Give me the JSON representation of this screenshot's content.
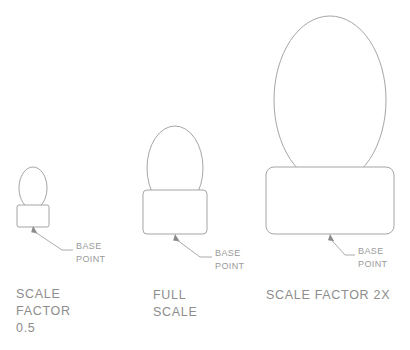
{
  "diagram": {
    "background_color": "#ffffff",
    "stroke_color": "#9b9b9b",
    "text_color": "#8d8d8d",
    "annotation_label_line1": "BASE",
    "annotation_label_line2": "POINT",
    "figures": [
      {
        "id": "small",
        "caption_lines": [
          "SCALE",
          "FACTOR",
          "0.5"
        ],
        "scale_factor": "0.5",
        "ellipse": {
          "cx": 33,
          "cy": 188,
          "rx": 14,
          "ry": 21
        },
        "rect": {
          "x": 17,
          "y": 205,
          "width": 32,
          "height": 22,
          "radius": 2
        },
        "base_point": {
          "x": 33,
          "y": 226
        },
        "leader": {
          "elbow_x": 62,
          "elbow_y": 250,
          "end_x": 73,
          "end_y": 250
        },
        "label_x": 76,
        "label_y_line1": 249,
        "label_y_line2": 262,
        "caption_x": 16,
        "caption_y": 298,
        "caption_line_height": 17
      },
      {
        "id": "full",
        "caption_lines": [
          "FULL",
          "SCALE"
        ],
        "scale_factor": "1",
        "ellipse": {
          "cx": 175,
          "cy": 168,
          "rx": 28,
          "ry": 42
        },
        "rect": {
          "x": 143,
          "y": 190,
          "width": 64,
          "height": 44,
          "radius": 4
        },
        "base_point": {
          "x": 175,
          "y": 234
        },
        "leader": {
          "elbow_x": 200,
          "elbow_y": 257,
          "end_x": 212,
          "end_y": 257
        },
        "label_x": 215,
        "label_y_line1": 256,
        "label_y_line2": 269,
        "caption_x": 153,
        "caption_y": 299,
        "caption_line_height": 17
      },
      {
        "id": "double",
        "caption_lines": [
          "SCALE FACTOR  2X"
        ],
        "scale_factor": "2X",
        "ellipse": {
          "cx": 330,
          "cy": 100,
          "rx": 56,
          "ry": 84
        },
        "rect": {
          "x": 266,
          "y": 167,
          "width": 128,
          "height": 67,
          "radius": 8
        },
        "base_point": {
          "x": 330,
          "y": 234
        },
        "leader": {
          "elbow_x": 345,
          "elbow_y": 255,
          "end_x": 355,
          "end_y": 255
        },
        "label_x": 358,
        "label_y_line1": 254,
        "label_y_line2": 267,
        "caption_x": 266,
        "caption_y": 299,
        "caption_line_height": 17
      }
    ]
  }
}
